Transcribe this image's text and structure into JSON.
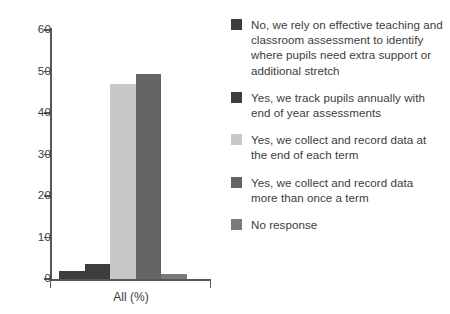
{
  "chart_data": {
    "type": "bar",
    "title": "",
    "subtitle": "",
    "xlabel": "All (%)",
    "ylabel": "",
    "categories": [
      "All (%)"
    ],
    "ylim": [
      0,
      60
    ],
    "yticks": [
      0,
      10,
      20,
      30,
      40,
      50,
      60
    ],
    "ytick_labels": [
      "0",
      "10",
      "20",
      "30",
      "40",
      "50",
      "60"
    ],
    "grid": false,
    "legend_position": "right",
    "series": [
      {
        "name": "No, we rely on effective teaching and classroom assessment to identify where pupils need extra support or additional stretch",
        "values": [
          2.0
        ],
        "color": "#3d3d3d"
      },
      {
        "name": "Yes, we track pupils annually with end of year assessments",
        "values": [
          3.5
        ],
        "color": "#3d3d3d"
      },
      {
        "name": "Yes, we collect and record data at the end of each term",
        "values": [
          47.0
        ],
        "color": "#c8c9c7"
      },
      {
        "name": "Yes, we collect and record data more than once a term",
        "values": [
          49.5
        ],
        "color": "#646464"
      },
      {
        "name": "No response",
        "values": [
          1.3
        ],
        "color": "#7a7a7a"
      }
    ]
  },
  "legend": {
    "items": [
      {
        "label": "No, we rely on effective teaching and classroom assessment to identify where pupils need extra support or additional stretch",
        "color": "#3d3d3d"
      },
      {
        "label": "Yes, we track pupils annually with end of year assessments",
        "color": "#3d3d3d"
      },
      {
        "label": "Yes, we collect and record data at the end of each term",
        "color": "#c8c9c7"
      },
      {
        "label": "Yes, we collect and record data more than once a term",
        "color": "#646464"
      },
      {
        "label": "No response",
        "color": "#7a7a7a"
      }
    ]
  },
  "axis": {
    "y_labels": [
      "60",
      "50",
      "40",
      "30",
      "20",
      "10",
      "0"
    ],
    "x_label": "All (%)"
  },
  "colors": {
    "axis": "#55585a",
    "text": "#3c3c3c",
    "background": "#ffffff"
  }
}
